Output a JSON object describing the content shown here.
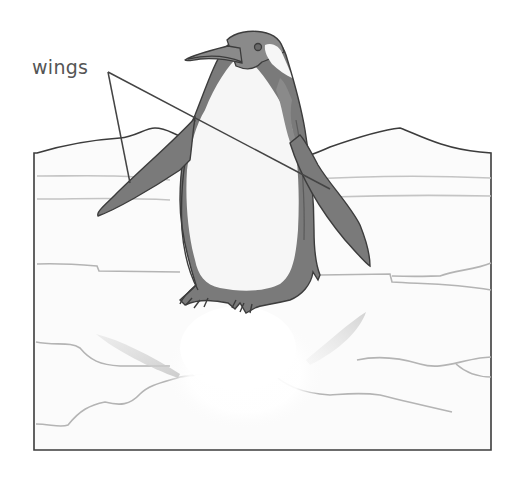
{
  "diagram": {
    "labels": [
      {
        "text": "wings",
        "x": 32,
        "y": 58
      }
    ],
    "leader_lines": {
      "anchor": {
        "x": 108,
        "y": 72
      },
      "targets": [
        {
          "name": "left-wing",
          "x": 130,
          "y": 183
        },
        {
          "name": "right-wing",
          "x": 330,
          "y": 189
        }
      ]
    },
    "colors": {
      "outline": "#3c3c3c",
      "penguin_dark": "#7a7a7a",
      "penguin_white": "#f6f6f6",
      "ice_lines": "#b4b4b4",
      "ice_fill": "#fbfbfb",
      "label_text": "#555555"
    }
  }
}
